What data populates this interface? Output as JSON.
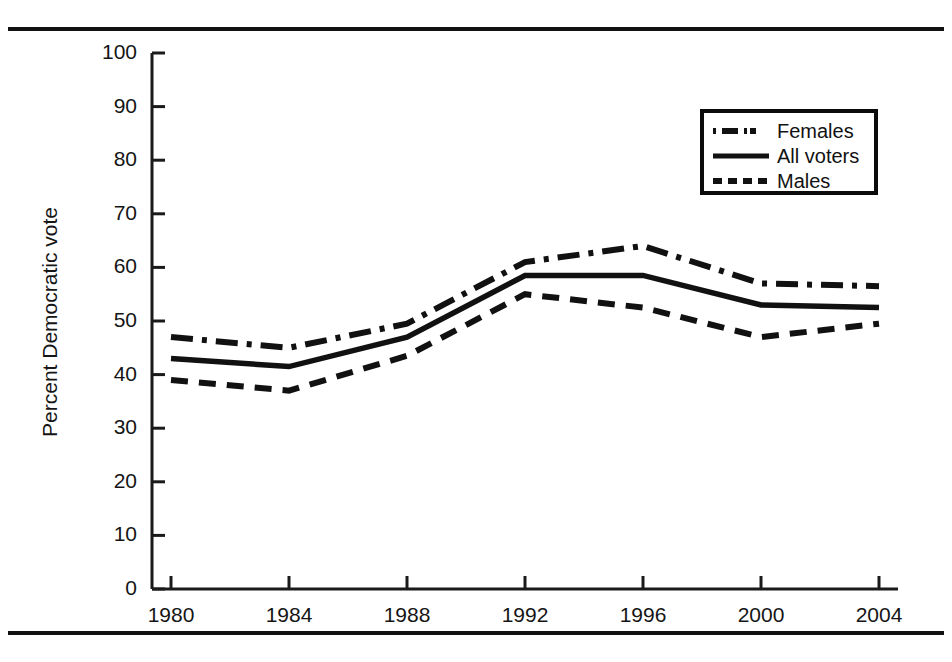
{
  "figure": {
    "has_top_rule": true,
    "has_bottom_rule": true,
    "background": "#ffffff",
    "ink_color": "#111111"
  },
  "axis": {
    "y_label": "Percent Democratic vote",
    "y_ticks": [
      "100",
      "90",
      "80",
      "70",
      "60",
      "50",
      "40",
      "30",
      "20",
      "10",
      "0"
    ],
    "x_ticks": [
      "1980",
      "1984",
      "1988",
      "1992",
      "1996",
      "2000",
      "2004"
    ]
  },
  "legend": {
    "items": [
      {
        "label": "Females",
        "style": "dash-dot",
        "color": "#111111"
      },
      {
        "label": "All voters",
        "style": "solid",
        "color": "#111111"
      },
      {
        "label": "Males",
        "style": "dashed",
        "color": "#111111"
      }
    ]
  },
  "chart_data": {
    "type": "line",
    "title": "",
    "subtitle": "",
    "xlabel": "",
    "ylabel": "Percent Democratic vote",
    "categories": [
      "1980",
      "1984",
      "1988",
      "1992",
      "1996",
      "2000",
      "2004"
    ],
    "x": [
      1980,
      1984,
      1988,
      1992,
      1996,
      2000,
      2004
    ],
    "xlim": [
      1980,
      2004
    ],
    "ylim": [
      0,
      100
    ],
    "y_tick_values": [
      0,
      10,
      20,
      30,
      40,
      50,
      60,
      70,
      80,
      90,
      100
    ],
    "y_tick_step": 10,
    "grid": false,
    "legend_position": "upper-right",
    "series": [
      {
        "name": "Females",
        "style": "dash-dot",
        "color": "#111111",
        "values": [
          47,
          45,
          49.5,
          61,
          64,
          57,
          56.5
        ]
      },
      {
        "name": "All voters",
        "style": "solid",
        "color": "#111111",
        "values": [
          43,
          41.5,
          47,
          58.5,
          58.5,
          53,
          52.5
        ]
      },
      {
        "name": "Males",
        "style": "dashed",
        "color": "#111111",
        "values": [
          39,
          37,
          43.5,
          55,
          52.5,
          47,
          49.5
        ]
      }
    ]
  }
}
